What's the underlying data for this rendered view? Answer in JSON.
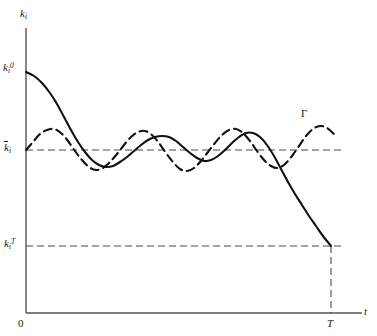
{
  "figure": {
    "background_color": "#ffffff",
    "ink_color": "#1a1a1a",
    "dash_color": "#3a3a3a"
  },
  "axes": {
    "y_axis_label": "k",
    "y_axis_label_sub": "i",
    "x_axis_label": "t",
    "origin_label": "0"
  },
  "annotations": {
    "initial_capital": {
      "base": "k",
      "sub": "i",
      "sup": "0"
    },
    "steady_state": {
      "base": "k",
      "sub": "i"
    },
    "terminal_capital": {
      "base": "k",
      "sub": "i",
      "sup": "T"
    },
    "terminal_time": "T",
    "divergent_path": "Γ"
  },
  "chart_data": {
    "type": "line",
    "title": "",
    "xlabel": "t",
    "ylabel": "k_i",
    "xlim": [
      0,
      377
    ],
    "ylim": [
      0,
      336
    ],
    "grid": false,
    "legend_position": "inline-annotation",
    "reference_lines": [
      {
        "name": "steady-state-level",
        "orientation": "horizontal",
        "label": "k̄_i",
        "y_px": 150,
        "style": "dashed",
        "x_start_px": 26,
        "x_end_px": 345
      },
      {
        "name": "terminal-capital-level",
        "orientation": "horizontal",
        "label": "k_i^T",
        "y_px": 246,
        "style": "dashed",
        "x_start_px": 26,
        "x_end_px": 345
      },
      {
        "name": "terminal-time-line",
        "orientation": "vertical",
        "label": "T",
        "x_px": 331,
        "style": "dashed",
        "y_start_px": 246,
        "y_end_px": 313
      }
    ],
    "series": [
      {
        "name": "optimal-path",
        "style": "solid",
        "label": "",
        "description": "Starts at k_i^0, declines, oscillates about k̄_i with damping, then diverges downward to k_i^T at time T",
        "points_px": [
          [
            26,
            72
          ],
          [
            34,
            76
          ],
          [
            42,
            83
          ],
          [
            50,
            93
          ],
          [
            57,
            104
          ],
          [
            64,
            117
          ],
          [
            71,
            130
          ],
          [
            78,
            142
          ],
          [
            85,
            152
          ],
          [
            92,
            160
          ],
          [
            99,
            165
          ],
          [
            106,
            167
          ],
          [
            113,
            166
          ],
          [
            120,
            162
          ],
          [
            127,
            157
          ],
          [
            134,
            151
          ],
          [
            141,
            145
          ],
          [
            148,
            140
          ],
          [
            155,
            137
          ],
          [
            162,
            136
          ],
          [
            169,
            137
          ],
          [
            176,
            141
          ],
          [
            183,
            147
          ],
          [
            190,
            153
          ],
          [
            197,
            158
          ],
          [
            204,
            161
          ],
          [
            211,
            160
          ],
          [
            218,
            156
          ],
          [
            225,
            150
          ],
          [
            232,
            143
          ],
          [
            239,
            137
          ],
          [
            246,
            133
          ],
          [
            253,
            133
          ],
          [
            260,
            137
          ],
          [
            267,
            145
          ],
          [
            274,
            156
          ],
          [
            281,
            169
          ],
          [
            288,
            182
          ],
          [
            295,
            194
          ],
          [
            302,
            205
          ],
          [
            309,
            216
          ],
          [
            316,
            226
          ],
          [
            323,
            236
          ],
          [
            331,
            246
          ]
        ]
      },
      {
        "name": "divergent-path-gamma",
        "style": "dashed",
        "label": "Γ",
        "description": "Persistent undamped oscillation about k̄_i continuing past T-neighbourhood",
        "points_px": [
          [
            26,
            150
          ],
          [
            33,
            142
          ],
          [
            40,
            134
          ],
          [
            47,
            130
          ],
          [
            54,
            129
          ],
          [
            61,
            133
          ],
          [
            68,
            141
          ],
          [
            75,
            151
          ],
          [
            82,
            160
          ],
          [
            89,
            167
          ],
          [
            96,
            170
          ],
          [
            103,
            168
          ],
          [
            110,
            162
          ],
          [
            117,
            154
          ],
          [
            124,
            145
          ],
          [
            131,
            137
          ],
          [
            138,
            132
          ],
          [
            145,
            131
          ],
          [
            152,
            135
          ],
          [
            159,
            143
          ],
          [
            166,
            153
          ],
          [
            173,
            162
          ],
          [
            180,
            169
          ],
          [
            187,
            171
          ],
          [
            194,
            168
          ],
          [
            201,
            161
          ],
          [
            208,
            152
          ],
          [
            215,
            143
          ],
          [
            222,
            135
          ],
          [
            229,
            130
          ],
          [
            236,
            129
          ],
          [
            243,
            133
          ],
          [
            250,
            141
          ],
          [
            257,
            151
          ],
          [
            264,
            160
          ],
          [
            271,
            166
          ],
          [
            278,
            168
          ],
          [
            285,
            164
          ],
          [
            292,
            156
          ],
          [
            299,
            146
          ],
          [
            306,
            136
          ],
          [
            313,
            129
          ],
          [
            320,
            126
          ],
          [
            327,
            128
          ],
          [
            334,
            134
          ]
        ]
      }
    ]
  }
}
